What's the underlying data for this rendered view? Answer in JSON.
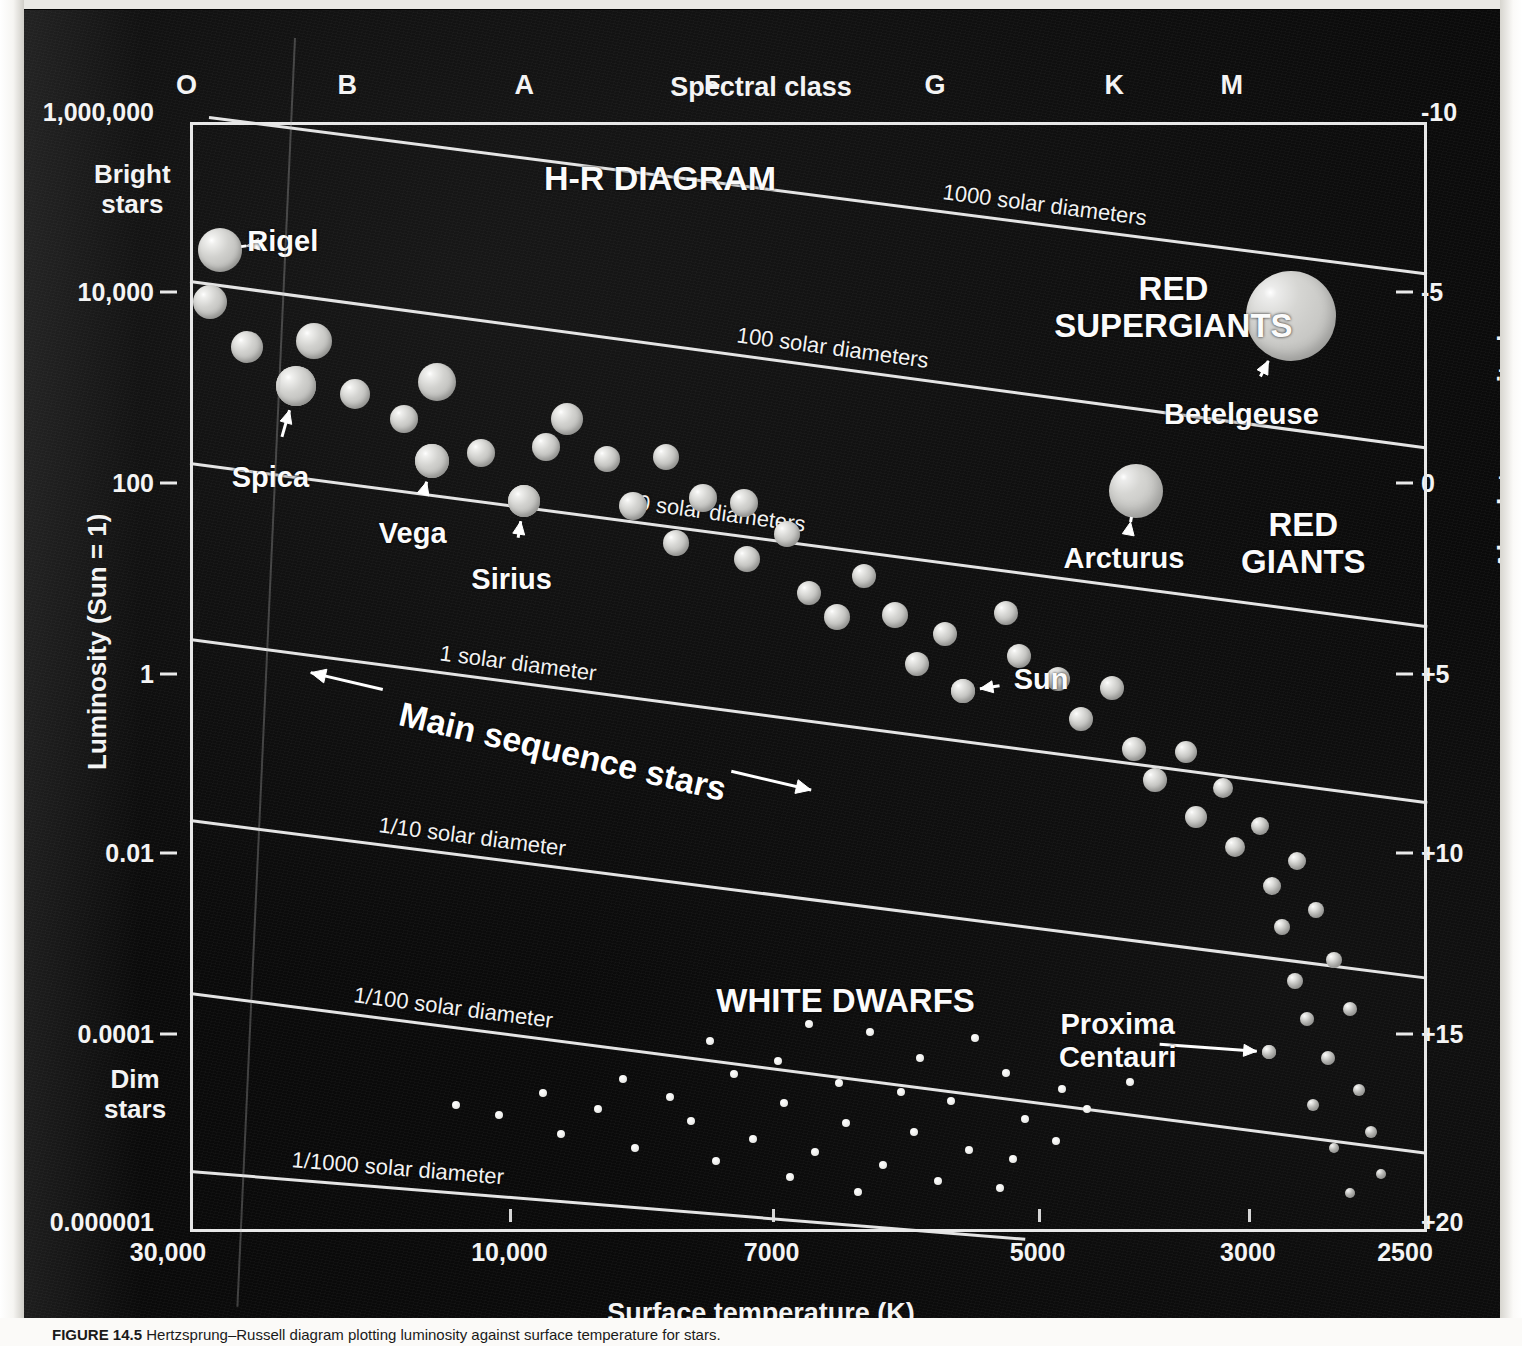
{
  "figure": {
    "title": "H-R DIAGRAM",
    "caption_prefix": "FIGURE 14.5",
    "caption_text": "Hertzsprung–Russell diagram plotting luminosity against surface temperature for stars."
  },
  "axes": {
    "top_axis_title": "Spectral class",
    "spectral_classes": [
      {
        "label": "O",
        "x_pct": 1.5
      },
      {
        "label": "B",
        "x_pct": 14.5
      },
      {
        "label": "A",
        "x_pct": 28.8
      },
      {
        "label": "F",
        "x_pct": 44.0
      },
      {
        "label": "G",
        "x_pct": 62.0
      },
      {
        "label": "K",
        "x_pct": 76.5
      },
      {
        "label": "M",
        "x_pct": 86.0
      }
    ],
    "left_axis_title": "Luminosity (Sun = 1)",
    "left_ticks": [
      {
        "label": "1,000,000",
        "y_pct": 0.0
      },
      {
        "label": "10,000",
        "y_pct": 16.2
      },
      {
        "label": "100",
        "y_pct": 33.4
      },
      {
        "label": "1",
        "y_pct": 50.6
      },
      {
        "label": "0.01",
        "y_pct": 66.8
      },
      {
        "label": "0.0001",
        "y_pct": 83.1
      },
      {
        "label": "0.000001",
        "y_pct": 100.0
      }
    ],
    "right_axis_title": "Absolute magnitude",
    "right_ticks": [
      {
        "label": "-10",
        "y_pct": 0.0
      },
      {
        "label": "-5",
        "y_pct": 16.2
      },
      {
        "label": "0",
        "y_pct": 33.4
      },
      {
        "label": "+5",
        "y_pct": 50.6
      },
      {
        "label": "+10",
        "y_pct": 66.8
      },
      {
        "label": "+15",
        "y_pct": 83.1
      },
      {
        "label": "+20",
        "y_pct": 100.0
      }
    ],
    "bottom_axis_title": "Surface temperature (K)",
    "bottom_ticks": [
      {
        "label": "30,000",
        "x_pct": 0.0
      },
      {
        "label": "10,000",
        "x_pct": 27.6
      },
      {
        "label": "7000",
        "x_pct": 48.8
      },
      {
        "label": "5000",
        "x_pct": 70.3
      },
      {
        "label": "3000",
        "x_pct": 87.3
      },
      {
        "label": "2500",
        "x_pct": 100.0
      }
    ],
    "brightness_notes": [
      {
        "text": "Bright\nstars",
        "x": 72,
        "y": 150
      },
      {
        "text": "Dim\nstars",
        "x": 82,
        "y": 1055
      }
    ]
  },
  "radius_lines": [
    {
      "label": "1000 solar diameters",
      "x1_pct": 1.5,
      "y1_pct": -0.5,
      "x2_pct": 100,
      "y2_pct": 13.6,
      "label_t": 0.6
    },
    {
      "label": "100 solar diameters",
      "x1_pct": 0.0,
      "y1_pct": 14.2,
      "x2_pct": 100,
      "y2_pct": 29.2,
      "label_t": 0.44
    },
    {
      "label": "10 solar diameters",
      "x1_pct": 0.0,
      "y1_pct": 30.6,
      "x2_pct": 100,
      "y2_pct": 45.3,
      "label_t": 0.35
    },
    {
      "label": "1 solar diameter",
      "x1_pct": 0.0,
      "y1_pct": 46.5,
      "x2_pct": 100,
      "y2_pct": 61.2,
      "label_t": 0.2
    },
    {
      "label": "1/10 solar diameter",
      "x1_pct": 0.0,
      "y1_pct": 62.8,
      "x2_pct": 100,
      "y2_pct": 77.0,
      "label_t": 0.15
    },
    {
      "label": "1/100 solar diameter",
      "x1_pct": 0.0,
      "y1_pct": 78.4,
      "x2_pct": 100,
      "y2_pct": 92.8,
      "label_t": 0.13
    },
    {
      "label": "1/1000 solar diameter",
      "x1_pct": 0.0,
      "y1_pct": 94.4,
      "x2_pct": 67.5,
      "y2_pct": 100.5,
      "label_t": 0.12
    }
  ],
  "regions": [
    {
      "name": "hr-diagram-title",
      "text": "H-R DIAGRAM",
      "x_pct": 38.0,
      "y_pct": 5.0,
      "size": 34
    },
    {
      "name": "red-supergiants",
      "text": "RED\nSUPERGIANTS",
      "x_pct": 79.5,
      "y_pct": 16.8,
      "size": 33
    },
    {
      "name": "red-giants",
      "text": "RED\nGIANTS",
      "x_pct": 90.0,
      "y_pct": 38.0,
      "size": 33
    },
    {
      "name": "white-dwarfs",
      "text": "WHITE DWARFS",
      "x_pct": 53.0,
      "y_pct": 79.2,
      "size": 33
    }
  ],
  "main_sequence_annotation": {
    "label": "Main sequence stars",
    "x_pct": 17.0,
    "y_pct": 51.5,
    "rotation_deg": 13.2
  },
  "chart_data": {
    "type": "scatter",
    "title": "H-R DIAGRAM",
    "xlabel": "Surface temperature (K)",
    "ylabel": "Luminosity (Sun = 1)",
    "x2label": "Spectral class",
    "y2label": "Absolute magnitude",
    "xlim": [
      30000,
      2500
    ],
    "ylim": [
      1e-06,
      1000000.0
    ],
    "y2lim": [
      -10,
      20
    ],
    "x_scale": "reversed-log",
    "y_scale": "log",
    "grid": false,
    "legend": "none",
    "named_stars": [
      {
        "name": "Rigel",
        "x_pct": 2.4,
        "y_pct": 11.5,
        "r": 22,
        "kind": "supergiant",
        "label_x_pct": 7.5,
        "label_y_pct": 10.7,
        "arrow": "left"
      },
      {
        "name": "Spica",
        "x_pct": 8.6,
        "y_pct": 23.8,
        "r": 20,
        "kind": "main",
        "label_x_pct": 6.5,
        "label_y_pct": 32.0,
        "arrow": "up"
      },
      {
        "name": "Vega",
        "x_pct": 19.6,
        "y_pct": 30.5,
        "r": 17,
        "kind": "main",
        "label_x_pct": 18.0,
        "label_y_pct": 37.0,
        "arrow": "up"
      },
      {
        "name": "Sirius",
        "x_pct": 27.0,
        "y_pct": 34.1,
        "r": 16,
        "kind": "main",
        "label_x_pct": 26.0,
        "label_y_pct": 41.2,
        "arrow": "up"
      },
      {
        "name": "Sun",
        "x_pct": 62.5,
        "y_pct": 51.3,
        "r": 12,
        "kind": "main",
        "label_x_pct": 68.8,
        "label_y_pct": 50.2,
        "arrow": "left"
      },
      {
        "name": "Betelgeuse",
        "x_pct": 89.0,
        "y_pct": 17.5,
        "r": 45,
        "kind": "giant",
        "label_x_pct": 85.0,
        "label_y_pct": 26.3,
        "arrow": "up-right"
      },
      {
        "name": "Arcturus",
        "x_pct": 76.5,
        "y_pct": 33.2,
        "r": 27,
        "kind": "giant",
        "label_x_pct": 75.5,
        "label_y_pct": 39.3,
        "arrow": "up"
      },
      {
        "name": "Proxima\nCentauri",
        "x_pct": 87.2,
        "y_pct": 83.8,
        "r": 7,
        "kind": "main",
        "label_x_pct": 75.0,
        "label_y_pct": 82.8,
        "arrow": "right"
      }
    ],
    "main_sequence_points": [
      {
        "x_pct": 1.6,
        "y_pct": 16.2,
        "r": 17
      },
      {
        "x_pct": 4.6,
        "y_pct": 20.3,
        "r": 16
      },
      {
        "x_pct": 8.6,
        "y_pct": 23.8,
        "r": 20
      },
      {
        "x_pct": 10.0,
        "y_pct": 19.7,
        "r": 18
      },
      {
        "x_pct": 13.3,
        "y_pct": 24.5,
        "r": 15
      },
      {
        "x_pct": 17.3,
        "y_pct": 26.8,
        "r": 14
      },
      {
        "x_pct": 19.6,
        "y_pct": 30.5,
        "r": 17
      },
      {
        "x_pct": 20.0,
        "y_pct": 23.4,
        "r": 19
      },
      {
        "x_pct": 23.5,
        "y_pct": 29.8,
        "r": 14
      },
      {
        "x_pct": 27.0,
        "y_pct": 34.1,
        "r": 16
      },
      {
        "x_pct": 28.8,
        "y_pct": 29.3,
        "r": 14
      },
      {
        "x_pct": 30.5,
        "y_pct": 26.8,
        "r": 16
      },
      {
        "x_pct": 33.7,
        "y_pct": 30.4,
        "r": 13
      },
      {
        "x_pct": 35.8,
        "y_pct": 34.6,
        "r": 14
      },
      {
        "x_pct": 38.5,
        "y_pct": 30.2,
        "r": 13
      },
      {
        "x_pct": 39.3,
        "y_pct": 37.9,
        "r": 13
      },
      {
        "x_pct": 41.5,
        "y_pct": 33.9,
        "r": 14
      },
      {
        "x_pct": 44.8,
        "y_pct": 34.3,
        "r": 14
      },
      {
        "x_pct": 45.0,
        "y_pct": 39.4,
        "r": 13
      },
      {
        "x_pct": 48.3,
        "y_pct": 37.1,
        "r": 13
      },
      {
        "x_pct": 50.0,
        "y_pct": 42.4,
        "r": 12
      },
      {
        "x_pct": 52.3,
        "y_pct": 44.6,
        "r": 13
      },
      {
        "x_pct": 54.5,
        "y_pct": 40.9,
        "r": 12
      },
      {
        "x_pct": 57.0,
        "y_pct": 44.4,
        "r": 13
      },
      {
        "x_pct": 58.8,
        "y_pct": 48.8,
        "r": 12
      },
      {
        "x_pct": 61.0,
        "y_pct": 46.1,
        "r": 12
      },
      {
        "x_pct": 62.5,
        "y_pct": 51.3,
        "r": 12
      },
      {
        "x_pct": 66.0,
        "y_pct": 44.2,
        "r": 12
      },
      {
        "x_pct": 67.0,
        "y_pct": 48.1,
        "r": 12
      },
      {
        "x_pct": 70.2,
        "y_pct": 50.2,
        "r": 12
      },
      {
        "x_pct": 72.0,
        "y_pct": 53.8,
        "r": 12
      },
      {
        "x_pct": 74.5,
        "y_pct": 51.0,
        "r": 12
      },
      {
        "x_pct": 76.3,
        "y_pct": 56.5,
        "r": 12
      },
      {
        "x_pct": 78.0,
        "y_pct": 59.3,
        "r": 12
      },
      {
        "x_pct": 80.5,
        "y_pct": 56.8,
        "r": 11
      },
      {
        "x_pct": 81.3,
        "y_pct": 62.6,
        "r": 11
      },
      {
        "x_pct": 83.5,
        "y_pct": 60.0,
        "r": 10
      },
      {
        "x_pct": 84.5,
        "y_pct": 65.3,
        "r": 10
      },
      {
        "x_pct": 86.5,
        "y_pct": 63.4,
        "r": 9
      },
      {
        "x_pct": 87.5,
        "y_pct": 68.8,
        "r": 9
      },
      {
        "x_pct": 89.5,
        "y_pct": 66.6,
        "r": 9
      },
      {
        "x_pct": 88.3,
        "y_pct": 72.5,
        "r": 8
      },
      {
        "x_pct": 91.0,
        "y_pct": 71.0,
        "r": 8
      },
      {
        "x_pct": 92.5,
        "y_pct": 75.5,
        "r": 8
      },
      {
        "x_pct": 89.3,
        "y_pct": 77.4,
        "r": 8
      },
      {
        "x_pct": 93.8,
        "y_pct": 79.9,
        "r": 7
      },
      {
        "x_pct": 90.3,
        "y_pct": 80.8,
        "r": 7
      },
      {
        "x_pct": 87.2,
        "y_pct": 83.8,
        "r": 7
      },
      {
        "x_pct": 92.0,
        "y_pct": 84.3,
        "r": 7
      },
      {
        "x_pct": 94.5,
        "y_pct": 87.2,
        "r": 6
      },
      {
        "x_pct": 90.8,
        "y_pct": 88.6,
        "r": 6
      },
      {
        "x_pct": 95.5,
        "y_pct": 91.0,
        "r": 6
      },
      {
        "x_pct": 92.5,
        "y_pct": 92.4,
        "r": 5
      },
      {
        "x_pct": 96.3,
        "y_pct": 94.8,
        "r": 5
      },
      {
        "x_pct": 93.8,
        "y_pct": 96.5,
        "r": 5
      }
    ],
    "white_dwarf_points": [
      {
        "x_pct": 50.0,
        "y_pct": 81.3,
        "r": 4
      },
      {
        "x_pct": 42.0,
        "y_pct": 82.8,
        "r": 4
      },
      {
        "x_pct": 55.0,
        "y_pct": 82.0,
        "r": 4
      },
      {
        "x_pct": 63.5,
        "y_pct": 82.5,
        "r": 4
      },
      {
        "x_pct": 47.5,
        "y_pct": 84.6,
        "r": 4
      },
      {
        "x_pct": 59.0,
        "y_pct": 84.3,
        "r": 4
      },
      {
        "x_pct": 35.0,
        "y_pct": 86.2,
        "r": 4
      },
      {
        "x_pct": 44.0,
        "y_pct": 85.8,
        "r": 4
      },
      {
        "x_pct": 52.5,
        "y_pct": 86.6,
        "r": 4
      },
      {
        "x_pct": 66.0,
        "y_pct": 85.7,
        "r": 4
      },
      {
        "x_pct": 28.5,
        "y_pct": 87.5,
        "r": 4
      },
      {
        "x_pct": 38.8,
        "y_pct": 87.8,
        "r": 4
      },
      {
        "x_pct": 57.5,
        "y_pct": 87.4,
        "r": 4
      },
      {
        "x_pct": 70.5,
        "y_pct": 87.1,
        "r": 4
      },
      {
        "x_pct": 76.0,
        "y_pct": 86.5,
        "r": 4
      },
      {
        "x_pct": 21.5,
        "y_pct": 88.6,
        "r": 4
      },
      {
        "x_pct": 33.0,
        "y_pct": 88.9,
        "r": 4
      },
      {
        "x_pct": 48.0,
        "y_pct": 88.4,
        "r": 4
      },
      {
        "x_pct": 61.5,
        "y_pct": 88.2,
        "r": 4
      },
      {
        "x_pct": 72.5,
        "y_pct": 88.9,
        "r": 4
      },
      {
        "x_pct": 25.0,
        "y_pct": 89.5,
        "r": 4
      },
      {
        "x_pct": 40.5,
        "y_pct": 90.0,
        "r": 4
      },
      {
        "x_pct": 53.0,
        "y_pct": 90.2,
        "r": 4
      },
      {
        "x_pct": 67.5,
        "y_pct": 89.8,
        "r": 4
      },
      {
        "x_pct": 30.0,
        "y_pct": 91.2,
        "r": 4
      },
      {
        "x_pct": 45.5,
        "y_pct": 91.6,
        "r": 4
      },
      {
        "x_pct": 58.5,
        "y_pct": 91.0,
        "r": 4
      },
      {
        "x_pct": 36.0,
        "y_pct": 92.4,
        "r": 4
      },
      {
        "x_pct": 50.5,
        "y_pct": 92.8,
        "r": 4
      },
      {
        "x_pct": 63.0,
        "y_pct": 92.6,
        "r": 4
      },
      {
        "x_pct": 70.0,
        "y_pct": 91.8,
        "r": 4
      },
      {
        "x_pct": 42.5,
        "y_pct": 93.6,
        "r": 4
      },
      {
        "x_pct": 56.0,
        "y_pct": 94.0,
        "r": 4
      },
      {
        "x_pct": 66.5,
        "y_pct": 93.4,
        "r": 4
      },
      {
        "x_pct": 48.5,
        "y_pct": 95.0,
        "r": 4
      },
      {
        "x_pct": 60.5,
        "y_pct": 95.4,
        "r": 4
      },
      {
        "x_pct": 54.0,
        "y_pct": 96.4,
        "r": 4
      },
      {
        "x_pct": 65.5,
        "y_pct": 96.0,
        "r": 4
      }
    ]
  }
}
